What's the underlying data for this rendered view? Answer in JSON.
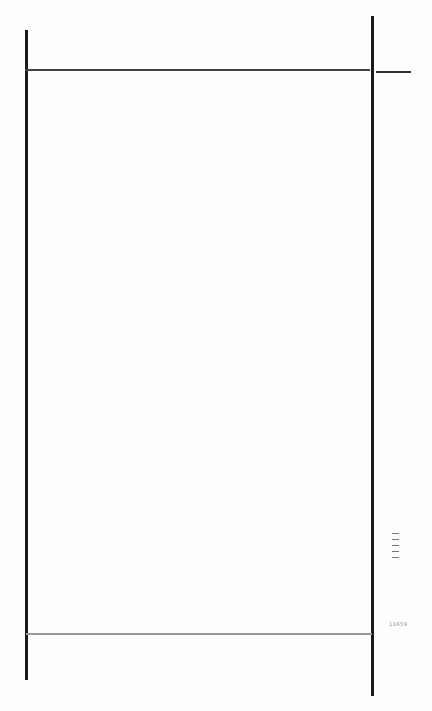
{
  "document": {
    "type": "scanned-page",
    "background": "#fefefe",
    "frame_color": "#1a1a1a",
    "margin_marks": {
      "side_glyph": "[|||]",
      "page_code": "11659"
    }
  }
}
